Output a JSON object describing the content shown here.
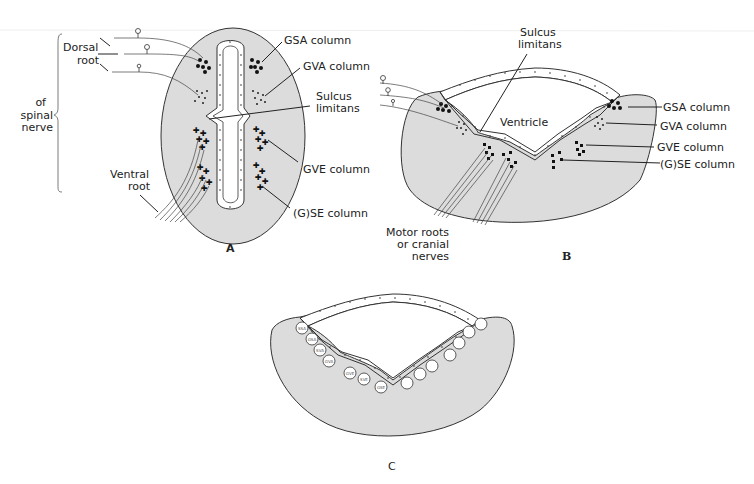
{
  "figure": {
    "panels": [
      {
        "id": "A",
        "label": "A",
        "description": "Spinal cord cross-section"
      },
      {
        "id": "B",
        "label": "B",
        "description": "Brainstem cross-section with open ventricle"
      },
      {
        "id": "C",
        "label": "C",
        "description": "Brainstem cross-section with labeled cell columns"
      }
    ],
    "panelA": {
      "dorsal_root": "Dorsal root",
      "dorsal_root_l1": "Dorsal",
      "dorsal_root_l2": "root",
      "of_spinal_nerve_l1": "of",
      "of_spinal_nerve_l2": "spinal",
      "of_spinal_nerve_l3": "nerve",
      "ventral_root_l1": "Ventral",
      "ventral_root_l2": "root",
      "gsa": "GSA column",
      "gva": "GVA column",
      "sulcus_l1": "Sulcus",
      "sulcus_l2": "limitans",
      "gve": "GVE column",
      "gse": "(G)SE column"
    },
    "panelB": {
      "sulcus_l1": "Sulcus",
      "sulcus_l2": "limitans",
      "ventricle": "Ventricle",
      "gsa": "GSA column",
      "gva": "GVA column",
      "gve": "GVE column",
      "gse": "(G)SE column",
      "motor_l1": "Motor roots",
      "motor_l2": "or cranial",
      "motor_l3": "nerves"
    },
    "panelC": {
      "circles": [
        "SSA",
        "GSA",
        "SVA",
        "GVA",
        "GVE",
        "SVE",
        "GSE"
      ]
    }
  }
}
